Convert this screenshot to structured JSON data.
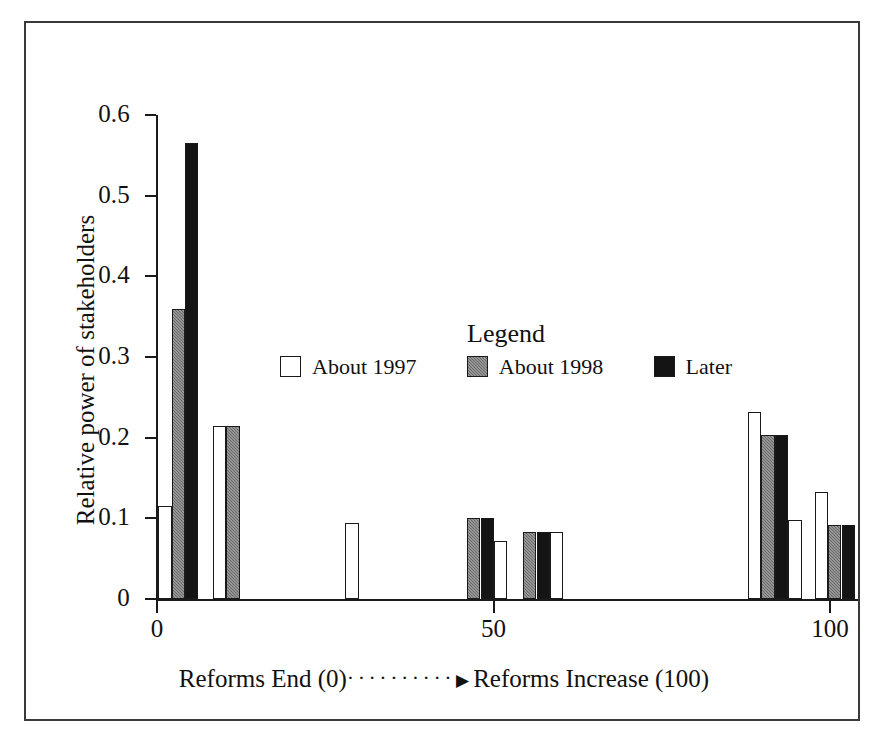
{
  "figure": {
    "background_color": "#ffffff",
    "frame_color": "#3a3a3a"
  },
  "legend": {
    "title": "Legend",
    "position": "inside-upper-center",
    "entries": [
      {
        "label": "About 1997",
        "fill": "white",
        "color": "#ffffff",
        "swatch_icon": "white-square-swatch"
      },
      {
        "label": "About 1998",
        "fill": "gray",
        "color": "#7d7d7d",
        "swatch_icon": "gray-square-swatch"
      },
      {
        "label": "Later",
        "fill": "black",
        "color": "#141414",
        "swatch_icon": "black-square-swatch"
      }
    ]
  },
  "axes": {
    "y_title": "Relative power of stakeholders",
    "y_ticks": [
      "0",
      "0.1",
      "0.2",
      "0.3",
      "0.4",
      "0.5",
      "0.6"
    ],
    "y_tick_values": [
      0,
      0.1,
      0.2,
      0.3,
      0.4,
      0.5,
      0.6
    ],
    "x_ticks": [
      "0",
      "50",
      "100"
    ],
    "x_tick_values": [
      0,
      50,
      100
    ],
    "x_title_left": "Reforms End (0)",
    "x_title_dots": "··········",
    "x_title_arrow": "▶",
    "x_title_right": "Reforms Increase (100)"
  },
  "chart_data": {
    "type": "bar",
    "title": "",
    "subtitle": "",
    "xlabel": "Reforms End (0) ··········▶ Reforms Increase (100)",
    "ylabel": "Relative power of stakeholders",
    "xlim": [
      0,
      104
    ],
    "ylim": [
      0,
      0.6
    ],
    "grid": false,
    "legend_position": "inside-upper-center",
    "legend_title": "Legend",
    "series_names": [
      "About 1997",
      "About 1998",
      "Later"
    ],
    "series_colors": [
      "#ffffff",
      "#7d7d7d",
      "#141414"
    ],
    "y_tick_labels": [
      "0",
      "0.1",
      "0.2",
      "0.3",
      "0.4",
      "0.5",
      "0.6"
    ],
    "x_tick_labels": [
      "0",
      "50",
      "100"
    ],
    "note": "Bars are drawn individually at irregular x positions; each bar is one stakeholder at one time period.",
    "bars": [
      {
        "x": 0.2,
        "value": 0.115,
        "series": "About 1997",
        "fill": "white"
      },
      {
        "x": 2.2,
        "value": 0.36,
        "series": "About 1998",
        "fill": "gray"
      },
      {
        "x": 4.2,
        "value": 0.565,
        "series": "Later",
        "fill": "black"
      },
      {
        "x": 8.3,
        "value": 0.215,
        "series": "About 1997",
        "fill": "white"
      },
      {
        "x": 10.3,
        "value": 0.215,
        "series": "About 1998",
        "fill": "gray"
      },
      {
        "x": 28.0,
        "value": 0.094,
        "series": "About 1997",
        "fill": "white"
      },
      {
        "x": 46.1,
        "value": 0.1,
        "series": "About 1998",
        "fill": "gray"
      },
      {
        "x": 48.1,
        "value": 0.1,
        "series": "Later",
        "fill": "black"
      },
      {
        "x": 50.1,
        "value": 0.072,
        "series": "About 1997",
        "fill": "white"
      },
      {
        "x": 54.4,
        "value": 0.083,
        "series": "About 1998",
        "fill": "gray"
      },
      {
        "x": 56.4,
        "value": 0.083,
        "series": "Later",
        "fill": "black"
      },
      {
        "x": 58.4,
        "value": 0.083,
        "series": "About 1997",
        "fill": "white"
      },
      {
        "x": 87.8,
        "value": 0.232,
        "series": "About 1997",
        "fill": "white"
      },
      {
        "x": 89.8,
        "value": 0.203,
        "series": "About 1998",
        "fill": "gray"
      },
      {
        "x": 91.8,
        "value": 0.203,
        "series": "Later",
        "fill": "black"
      },
      {
        "x": 93.8,
        "value": 0.098,
        "series": "About 1997",
        "fill": "white"
      },
      {
        "x": 97.7,
        "value": 0.133,
        "series": "About 1997",
        "fill": "white"
      },
      {
        "x": 99.7,
        "value": 0.092,
        "series": "About 1998",
        "fill": "gray"
      },
      {
        "x": 101.7,
        "value": 0.092,
        "series": "Later",
        "fill": "black"
      }
    ]
  }
}
